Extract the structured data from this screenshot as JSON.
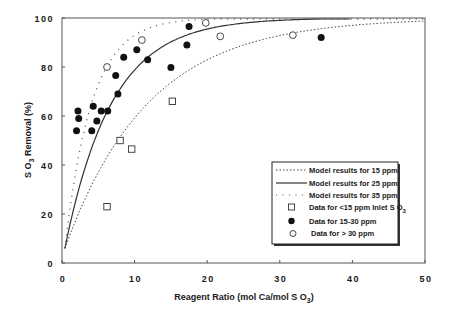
{
  "chart_data": {
    "type": "scatter",
    "title": "",
    "xlabel": "Reagent Ratio (mol Ca/mol SO3)",
    "ylabel": "SO3 Removal (%)",
    "xlim": [
      0,
      50
    ],
    "ylim": [
      0,
      100
    ],
    "xticks": [
      0,
      10,
      20,
      30,
      40,
      50
    ],
    "yticks": [
      0,
      20,
      40,
      60,
      80,
      100
    ],
    "grid": false,
    "legend_position": "lower right",
    "series": [
      {
        "name": "Model results for 15 ppm",
        "kind": "line",
        "style": "dotted",
        "model": "y = 100*(1-exp(-0.087*(x-0.3)))",
        "x": [
          0.3,
          2,
          4,
          6,
          8,
          10,
          12,
          15,
          20,
          25,
          30,
          35,
          40,
          45,
          50
        ],
        "values": [
          0,
          14,
          28,
          39,
          49,
          57,
          64,
          71,
          82,
          88,
          93,
          95,
          97,
          98,
          99
        ]
      },
      {
        "name": "Model results for 25 ppm",
        "kind": "line",
        "style": "solid",
        "model": "y = 100*(1-exp(-0.155*(x-0.3)))",
        "x": [
          0.3,
          2,
          4,
          6,
          8,
          10,
          12,
          15,
          20,
          25,
          30,
          35,
          40
        ],
        "values": [
          0,
          23,
          44,
          59,
          70,
          78,
          84,
          90,
          95,
          98,
          99,
          99.5,
          99.8
        ]
      },
      {
        "name": "Model results for 35 ppm",
        "kind": "line",
        "style": "sparse-dotted",
        "model": "y = 100*(1-exp(-0.27*(x-0.3)))",
        "x": [
          0.3,
          2,
          4,
          6,
          8,
          10,
          12,
          15,
          20,
          25,
          30
        ],
        "values": [
          0,
          37,
          63,
          79,
          88,
          93,
          96,
          98,
          99.5,
          99.9,
          100
        ]
      },
      {
        "name": "Data for <15 ppm Inlet SO3",
        "kind": "scatter",
        "marker": "open-square",
        "points": [
          [
            6.2,
            23
          ],
          [
            8.0,
            50
          ],
          [
            9.6,
            46.5
          ],
          [
            15.2,
            66
          ]
        ]
      },
      {
        "name": "Data for 15-30 ppm",
        "kind": "scatter",
        "marker": "filled-circle",
        "points": [
          [
            2.2,
            62
          ],
          [
            2.3,
            59
          ],
          [
            2.0,
            54
          ],
          [
            4.3,
            64
          ],
          [
            4.1,
            54
          ],
          [
            4.8,
            58
          ],
          [
            5.4,
            62
          ],
          [
            6.3,
            62
          ],
          [
            7.7,
            69
          ],
          [
            7.4,
            76.5
          ],
          [
            8.5,
            84
          ],
          [
            10.3,
            87
          ],
          [
            11.8,
            83
          ],
          [
            15.0,
            79.8
          ],
          [
            17.2,
            89
          ],
          [
            17.5,
            96.5
          ],
          [
            35.7,
            92
          ]
        ]
      },
      {
        "name": "Data for > 30 ppm",
        "kind": "scatter",
        "marker": "open-circle",
        "points": [
          [
            6.2,
            80
          ],
          [
            11.0,
            91
          ],
          [
            19.8,
            98
          ],
          [
            21.8,
            92.5
          ],
          [
            31.8,
            93
          ]
        ]
      }
    ]
  },
  "axes": {
    "x_title_main": "Reagent  Ratio  (mol Ca/mol S O",
    "x_title_sub": "3",
    "x_title_end": ")",
    "y_title_main": "S O",
    "y_title_sub": "3",
    "y_title_end": " Removal (%)",
    "x_tick_labels": [
      "0",
      "10",
      "20",
      "30",
      "40",
      "50"
    ],
    "y_tick_labels": [
      "0",
      "20",
      "40",
      "60",
      "80",
      "100"
    ]
  },
  "legend": {
    "items": [
      {
        "label": "Model results for 15 ppm"
      },
      {
        "label": "Model results for 25 ppm"
      },
      {
        "label": "Model results for 35 ppm"
      },
      {
        "label": "Data for <15  ppm  Inlet S O",
        "sub": "3"
      },
      {
        "label": "Data for 15-30  ppm"
      },
      {
        "label": "Data for > 30  ppm"
      }
    ]
  },
  "colors": {
    "ink": "#1a1a1a",
    "axis": "#555555",
    "background": "#ffffff"
  }
}
